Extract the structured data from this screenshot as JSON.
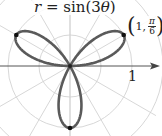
{
  "chart_data": {
    "type": "line",
    "subtype": "polar",
    "title": "r = sin(3θ)",
    "equation": "r = sin(3θ)",
    "theta_range": [
      0,
      3.14159
    ],
    "series": [
      {
        "name": "rose curve r = sin(3θ)",
        "petals": 3,
        "petal_angles_deg": [
          30,
          150,
          270
        ],
        "max_r": 1
      }
    ],
    "marked_points": [
      {
        "label": "(1, π/6)",
        "r": 1,
        "theta": "π/6"
      },
      {
        "label": "",
        "r": 1,
        "theta": "5π/6"
      },
      {
        "label": "",
        "r": -1,
        "theta": "π/2"
      }
    ],
    "annotations": [
      "(1, π/6)",
      "1"
    ],
    "grid": {
      "circles_r": [
        0.5,
        1,
        1.5
      ],
      "radial_step_deg": 30,
      "visible": true
    },
    "axis": {
      "polar_axis_tick": "1",
      "arrow": true
    }
  },
  "labels": {
    "title_prefix": "r",
    "title_eq": " = sin(3",
    "title_theta": "θ",
    "title_suffix": ")",
    "point_r": "1",
    "point_num": "π",
    "point_den": "6",
    "axis_tick": "1"
  },
  "colors": {
    "curve": "#555555",
    "grid": "#cfcfcf",
    "axis": "#444444",
    "point": "#111111"
  }
}
